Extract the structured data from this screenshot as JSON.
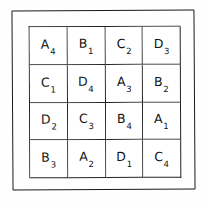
{
  "figure": {
    "background_color": "#fefefe",
    "line_color": "#1a1a1a",
    "text_color": "#111111"
  },
  "grid": {
    "rows": 4,
    "columns": 4,
    "cells": [
      {
        "letter": "A",
        "subscript": "4"
      },
      {
        "letter": "B",
        "subscript": "1"
      },
      {
        "letter": "C",
        "subscript": "2"
      },
      {
        "letter": "D",
        "subscript": "3"
      },
      {
        "letter": "C",
        "subscript": "1"
      },
      {
        "letter": "D",
        "subscript": "4"
      },
      {
        "letter": "A",
        "subscript": "3"
      },
      {
        "letter": "B",
        "subscript": "2"
      },
      {
        "letter": "D",
        "subscript": "2"
      },
      {
        "letter": "C",
        "subscript": "3"
      },
      {
        "letter": "B",
        "subscript": "4"
      },
      {
        "letter": "A",
        "subscript": "1"
      },
      {
        "letter": "B",
        "subscript": "3"
      },
      {
        "letter": "A",
        "subscript": "2"
      },
      {
        "letter": "D",
        "subscript": "1"
      },
      {
        "letter": "C",
        "subscript": "4"
      }
    ]
  }
}
